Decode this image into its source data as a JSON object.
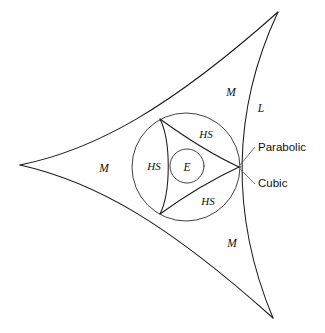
{
  "figure": {
    "background_color": "#ffffff",
    "stroke_color": "#1a1a1a",
    "leader_color": "#5a5a5a"
  },
  "region_labels": [
    {
      "id": "m-left",
      "text": "M",
      "x": 104,
      "y": 172,
      "style": "italic-serif"
    },
    {
      "id": "m-top",
      "text": "M",
      "x": 231,
      "y": 96,
      "style": "italic-serif"
    },
    {
      "id": "m-bottom",
      "text": "M",
      "x": 232,
      "y": 247,
      "style": "italic-serif"
    },
    {
      "id": "l-right",
      "text": "L",
      "x": 261,
      "y": 112,
      "style": "italic-serif"
    },
    {
      "id": "hs-top",
      "text": "HS",
      "x": 206,
      "y": 138,
      "style": "italic-serif"
    },
    {
      "id": "hs-left",
      "text": "HS",
      "x": 154,
      "y": 170,
      "style": "italic-serif"
    },
    {
      "id": "hs-bottom",
      "text": "HS",
      "x": 208,
      "y": 205,
      "style": "italic-serif"
    },
    {
      "id": "e-center",
      "text": "E",
      "x": 187,
      "y": 171,
      "style": "italic-serif"
    }
  ],
  "callouts": [
    {
      "id": "parabolic",
      "text": "Parabolic",
      "x": 258,
      "y": 151,
      "leader_from_x": 241,
      "leader_from_y": 165,
      "leader_to_x": 254,
      "leader_to_y": 147
    },
    {
      "id": "cubic",
      "text": "Cubic",
      "x": 258,
      "y": 187,
      "leader_from_x": 241,
      "leader_from_y": 169,
      "leader_to_x": 254,
      "leader_to_y": 184
    }
  ],
  "geometry": {
    "outer_deltoid_cusps": [
      {
        "x": 20,
        "y": 165
      },
      {
        "x": 278,
        "y": 12
      },
      {
        "x": 273,
        "y": 318
      }
    ],
    "inscribed_circle": {
      "cx": 186,
      "cy": 167,
      "r": 54
    },
    "inner_circle": {
      "cx": 187,
      "cy": 166,
      "r": 17
    },
    "inner_deltoid_cusps": [
      {
        "x": 160,
        "y": 119
      },
      {
        "x": 160,
        "y": 214
      },
      {
        "x": 239,
        "y": 167
      }
    ],
    "curve_names": [
      "Parabolic",
      "Cubic"
    ]
  }
}
